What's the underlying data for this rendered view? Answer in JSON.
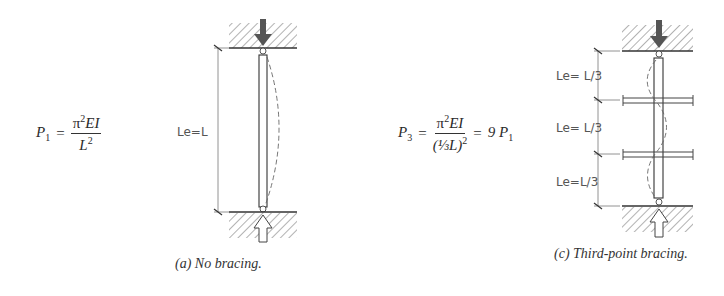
{
  "figure_a": {
    "equation": {
      "lhs": "P",
      "lhs_sub": "1",
      "eq_sign": "=",
      "numerator": "π",
      "numerator_sup": "2",
      "numerator_rest": "EI",
      "denominator": "L",
      "denominator_sup": "2"
    },
    "dimension_label": "Le=L",
    "caption": "(a) No bracing.",
    "bracing_points": 0
  },
  "figure_c": {
    "equation": {
      "lhs": "P",
      "lhs_sub": "3",
      "eq_sign": "=",
      "numerator": "π",
      "numerator_sup": "2",
      "numerator_rest": "EI",
      "denominator": "(⅓L)",
      "denominator_sup": "2",
      "eq_sign_2": "=",
      "result": "9 P",
      "result_sub": "1"
    },
    "dimension_labels": [
      "Le= L/3",
      "Le= L/3",
      "Le=L/3"
    ],
    "caption": "(c) Third-point bracing.",
    "bracing_points": 2
  },
  "colors": {
    "line": "#333333",
    "hatch": "#555555",
    "arrow_fill": "#555555",
    "dashed_curve": "#666666"
  }
}
